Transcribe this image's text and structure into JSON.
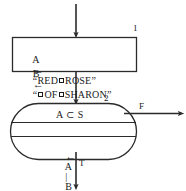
{
  "diagram": {
    "type": "flowchart",
    "process_box": {
      "tag": "1",
      "lines": [
        {
          "id": "line-a",
          "variable": "A",
          "operator": "←",
          "open_quote": "“",
          "part1": "RED",
          "blank": "□",
          "part2": "ROSE",
          "close_quote": "”"
        },
        {
          "id": "line-b",
          "variable": "B",
          "operator": "←",
          "open_quote": "“",
          "part1": "",
          "blank": "□",
          "part2": "OF",
          "blank2": "□",
          "part3": "SHARON",
          "close_quote": "”"
        }
      ],
      "line_a_text": "A ← “RED□ROSE”",
      "line_b_text": "B ← “□OF□SHARON”"
    },
    "loop_shape": {
      "tag": "2",
      "condition_text": "A ⊂ S",
      "body_text": "← A | B",
      "body_arrow": "←",
      "body_left_operand": "A",
      "body_separator": "|",
      "body_right_operand": "B"
    },
    "branches": {
      "false_label": "F",
      "true_label": "T"
    },
    "colors": {
      "stroke": "#2b2b2b",
      "text": "#1a1a1a",
      "background": "#ffffff"
    }
  }
}
